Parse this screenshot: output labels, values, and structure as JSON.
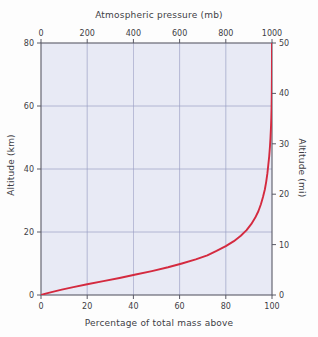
{
  "chart_data": {
    "type": "line",
    "title": "",
    "xlabel": "Percentage of total mass above",
    "ylabel": "Altitude (km)",
    "x2label": "Atmospheric pressure (mb)",
    "y2label": "Altitude (mi)",
    "xlim": [
      0,
      100
    ],
    "ylim": [
      0,
      80
    ],
    "x2lim": [
      0,
      1000
    ],
    "y2lim": [
      0,
      50
    ],
    "grid": true,
    "legend": null,
    "xticks": [
      0,
      20,
      40,
      60,
      80,
      100
    ],
    "xtick_labels": [
      "0",
      "20",
      "40",
      "60",
      "80",
      "100"
    ],
    "yticks": [
      0,
      20,
      40,
      60,
      80
    ],
    "ytick_labels": [
      "0",
      "20",
      "40",
      "60",
      "80"
    ],
    "x2ticks": [
      0,
      200,
      400,
      600,
      800,
      1000
    ],
    "x2tick_labels": [
      "0",
      "200",
      "400",
      "600",
      "800",
      "1000"
    ],
    "y2ticks": [
      0,
      10,
      20,
      30,
      40,
      50
    ],
    "y2tick_labels": [
      "0",
      "10",
      "20",
      "30",
      "40",
      "50"
    ],
    "series": [
      {
        "name": "mass above vs altitude",
        "color": "#d42a3f",
        "x": [
          0,
          2,
          5,
          9,
          14,
          20,
          27,
          34,
          41,
          48,
          55,
          61,
          67,
          72,
          76,
          80,
          83.5,
          86.5,
          89,
          91,
          92.7,
          94.1,
          95.2,
          96.1,
          96.9,
          97.5,
          98.0,
          98.4,
          98.8,
          99.1,
          99.35,
          99.55,
          99.7,
          99.82,
          99.9,
          99.96,
          100
        ],
        "y": [
          0,
          0.45,
          1.0,
          1.7,
          2.5,
          3.4,
          4.4,
          5.4,
          6.5,
          7.6,
          8.8,
          10.0,
          11.3,
          12.6,
          14.0,
          15.5,
          17.1,
          18.8,
          20.6,
          22.5,
          24.5,
          26.6,
          28.8,
          31.1,
          33.5,
          36.0,
          38.6,
          41.3,
          44.1,
          47.0,
          50.0,
          53.1,
          56.3,
          59.6,
          64.0,
          70.0,
          80.0
        ]
      }
    ]
  },
  "axes": {
    "top": {
      "title": "Atmospheric pressure (mb)",
      "tick_labels": [
        "0",
        "200",
        "400",
        "600",
        "800",
        "1000"
      ]
    },
    "bottom": {
      "title": "Percentage of total mass above",
      "tick_labels": [
        "0",
        "20",
        "40",
        "60",
        "80",
        "100"
      ]
    },
    "left": {
      "title": "Altitude (km)",
      "tick_labels": [
        "80",
        "60",
        "40",
        "20",
        "0"
      ]
    },
    "right": {
      "title": "Altitude (mi)",
      "tick_labels": [
        "50",
        "40",
        "30",
        "20",
        "10",
        "0"
      ]
    }
  },
  "colors": {
    "curve": "#d42a3f",
    "plot_background": "#e8eaf5",
    "grid": "#9aa0c4",
    "axis": "#5a5a66",
    "text": "#3d3d45",
    "page_background": "#fdfdfd"
  }
}
